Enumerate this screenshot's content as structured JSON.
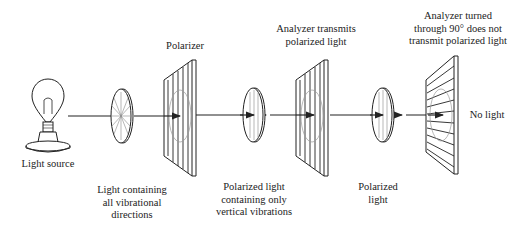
{
  "labels": {
    "light_source": "Light source",
    "unpolarized": [
      "Light containing",
      "all vibrational",
      "directions"
    ],
    "polarizer": "Polarizer",
    "polarized_vertical": [
      "Polarized light",
      "containing only",
      "vertical vibrations"
    ],
    "analyzer_transmits": [
      "Analyzer transmits",
      "polarized light"
    ],
    "polarized": [
      "Polarized",
      "light"
    ],
    "analyzer_turned": [
      "Analyzer turned",
      "through 90° does not",
      "transmit polarized light"
    ],
    "no_light": "No light"
  },
  "colors": {
    "ink": "#222222",
    "light_gray": "#999999"
  }
}
